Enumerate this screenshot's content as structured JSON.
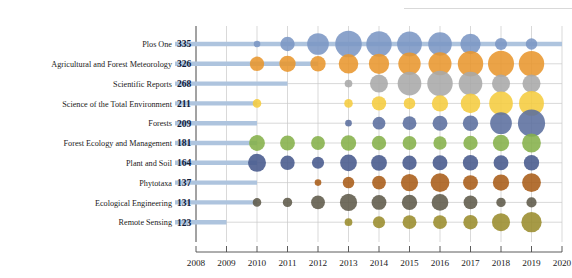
{
  "chart_data": {
    "type": "scatter",
    "subtype": "bubble-matrix-with-lollipop",
    "title": "",
    "xlabel": "",
    "ylabel": "",
    "x": [
      2008,
      2009,
      2010,
      2011,
      2012,
      2013,
      2014,
      2015,
      2016,
      2017,
      2018,
      2019,
      2020
    ],
    "xtick_labels": [
      "2008",
      "2009",
      "2010",
      "2011",
      "2012",
      "2013",
      "2014",
      "2015",
      "2016",
      "2017",
      "2018",
      "2019",
      "2020"
    ],
    "xlim": [
      2008,
      2020
    ],
    "grid": true,
    "legend": "none",
    "categories": [
      "Plos One",
      "Agricultural and Forest Meteorology",
      "Scientific Reports",
      "Science of the Total Environment",
      "Forests",
      "Forest Ecology and Management",
      "Plant and Soil",
      "Phytotaxa",
      "Ecological Engineering",
      "Remote Sensing"
    ],
    "totals": [
      335,
      326,
      268,
      211,
      209,
      181,
      164,
      137,
      131,
      123
    ],
    "series": [
      {
        "name": "Plos One",
        "total": 335,
        "color": "#7b96c4",
        "lollipop_end_year": 2020,
        "points": [
          {
            "year": 2010,
            "value": 3
          },
          {
            "year": 2011,
            "value": 14
          },
          {
            "year": 2012,
            "value": 32
          },
          {
            "year": 2013,
            "value": 48
          },
          {
            "year": 2014,
            "value": 44
          },
          {
            "year": 2015,
            "value": 42
          },
          {
            "year": 2016,
            "value": 38
          },
          {
            "year": 2017,
            "value": 28
          },
          {
            "year": 2018,
            "value": 10
          },
          {
            "year": 2019,
            "value": 9
          }
        ]
      },
      {
        "name": "Agricultural and Forest Meteorology",
        "total": 326,
        "color": "#e8962e",
        "lollipop_end_year": 2012,
        "points": [
          {
            "year": 2010,
            "value": 14
          },
          {
            "year": 2011,
            "value": 18
          },
          {
            "year": 2012,
            "value": 16
          },
          {
            "year": 2013,
            "value": 26
          },
          {
            "year": 2014,
            "value": 28
          },
          {
            "year": 2015,
            "value": 34
          },
          {
            "year": 2016,
            "value": 36
          },
          {
            "year": 2017,
            "value": 44
          },
          {
            "year": 2018,
            "value": 46
          },
          {
            "year": 2019,
            "value": 44
          }
        ]
      },
      {
        "name": "Scientific Reports",
        "total": 268,
        "color": "#a9a9a9",
        "lollipop_end_year": 2011,
        "points": [
          {
            "year": 2013,
            "value": 4
          },
          {
            "year": 2014,
            "value": 22
          },
          {
            "year": 2015,
            "value": 38
          },
          {
            "year": 2016,
            "value": 44
          },
          {
            "year": 2017,
            "value": 38
          },
          {
            "year": 2018,
            "value": 22
          },
          {
            "year": 2019,
            "value": 22
          }
        ]
      },
      {
        "name": "Science of the Total Environment",
        "total": 211,
        "color": "#f5cc3f",
        "lollipop_end_year": 2010,
        "points": [
          {
            "year": 2010,
            "value": 5
          },
          {
            "year": 2013,
            "value": 5
          },
          {
            "year": 2014,
            "value": 14
          },
          {
            "year": 2015,
            "value": 9
          },
          {
            "year": 2016,
            "value": 18
          },
          {
            "year": 2017,
            "value": 26
          },
          {
            "year": 2018,
            "value": 38
          },
          {
            "year": 2019,
            "value": 42
          }
        ]
      },
      {
        "name": "Forests",
        "total": 209,
        "color": "#5b6e9e",
        "lollipop_end_year": 2010,
        "points": [
          {
            "year": 2013,
            "value": 3
          },
          {
            "year": 2014,
            "value": 11
          },
          {
            "year": 2015,
            "value": 13
          },
          {
            "year": 2016,
            "value": 15
          },
          {
            "year": 2017,
            "value": 16
          },
          {
            "year": 2018,
            "value": 32
          },
          {
            "year": 2019,
            "value": 50
          }
        ]
      },
      {
        "name": "Forest Ecology and Management",
        "total": 181,
        "color": "#85b04a",
        "lollipop_end_year": 2010,
        "points": [
          {
            "year": 2010,
            "value": 17
          },
          {
            "year": 2011,
            "value": 15
          },
          {
            "year": 2012,
            "value": 13
          },
          {
            "year": 2013,
            "value": 16
          },
          {
            "year": 2014,
            "value": 14
          },
          {
            "year": 2015,
            "value": 13
          },
          {
            "year": 2016,
            "value": 12
          },
          {
            "year": 2017,
            "value": 14
          },
          {
            "year": 2018,
            "value": 18
          },
          {
            "year": 2019,
            "value": 24
          }
        ]
      },
      {
        "name": "Plant and Soil",
        "total": 164,
        "color": "#47598c",
        "lollipop_end_year": 2010,
        "points": [
          {
            "year": 2010,
            "value": 22
          },
          {
            "year": 2011,
            "value": 14
          },
          {
            "year": 2012,
            "value": 10
          },
          {
            "year": 2013,
            "value": 19
          },
          {
            "year": 2014,
            "value": 17
          },
          {
            "year": 2015,
            "value": 14
          },
          {
            "year": 2016,
            "value": 15
          },
          {
            "year": 2017,
            "value": 16
          },
          {
            "year": 2018,
            "value": 15
          },
          {
            "year": 2019,
            "value": 16
          }
        ]
      },
      {
        "name": "Phytotaxa",
        "total": 137,
        "color": "#a85c18",
        "lollipop_end_year": 2010,
        "points": [
          {
            "year": 2012,
            "value": 3
          },
          {
            "year": 2013,
            "value": 9
          },
          {
            "year": 2014,
            "value": 13
          },
          {
            "year": 2015,
            "value": 20
          },
          {
            "year": 2016,
            "value": 24
          },
          {
            "year": 2017,
            "value": 15
          },
          {
            "year": 2018,
            "value": 18
          },
          {
            "year": 2019,
            "value": 24
          }
        ]
      },
      {
        "name": "Ecological Engineering",
        "total": 131,
        "color": "#5e5a4a",
        "lollipop_end_year": 2010,
        "points": [
          {
            "year": 2010,
            "value": 5
          },
          {
            "year": 2011,
            "value": 6
          },
          {
            "year": 2012,
            "value": 13
          },
          {
            "year": 2013,
            "value": 20
          },
          {
            "year": 2014,
            "value": 15
          },
          {
            "year": 2015,
            "value": 16
          },
          {
            "year": 2016,
            "value": 19
          },
          {
            "year": 2017,
            "value": 13
          },
          {
            "year": 2018,
            "value": 6
          },
          {
            "year": 2019,
            "value": 7
          }
        ]
      },
      {
        "name": "Remote Sensing",
        "total": 123,
        "color": "#9a8c2c",
        "lollipop_end_year": 2009,
        "points": [
          {
            "year": 2013,
            "value": 4
          },
          {
            "year": 2014,
            "value": 10
          },
          {
            "year": 2015,
            "value": 13
          },
          {
            "year": 2016,
            "value": 13
          },
          {
            "year": 2017,
            "value": 14
          },
          {
            "year": 2018,
            "value": 22
          },
          {
            "year": 2019,
            "value": 28
          }
        ]
      }
    ]
  },
  "colors": {
    "lollipop": "#aec4de",
    "grid": "#c9c9c9",
    "axis": "#4a4a4a",
    "value_text": "#10203a",
    "label_text": "#1a1a1a",
    "background": "#ffffff"
  }
}
